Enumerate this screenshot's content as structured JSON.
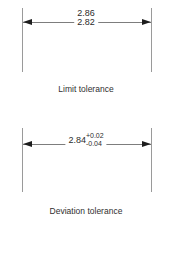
{
  "figures": [
    {
      "id": "limit-tolerance",
      "caption": "Limit tolerance",
      "upper_limit": "2.86",
      "lower_limit": "2.82"
    },
    {
      "id": "deviation-tolerance",
      "caption": "Deviation tolerance",
      "nominal": "2.84",
      "upper_deviation": "+0.02",
      "lower_deviation": "-0.04"
    }
  ],
  "colors": {
    "background": "#ffffff",
    "line": "#9a9a9a",
    "arrow": "#1d1d1d",
    "text": "#2b2b2b"
  }
}
